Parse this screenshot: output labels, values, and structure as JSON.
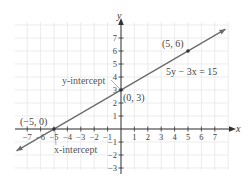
{
  "chart_data": {
    "type": "line",
    "title": "",
    "xlabel": "x",
    "ylabel": "y",
    "xlim": [
      -8,
      8
    ],
    "ylim": [
      -3.2,
      8
    ],
    "grid": true,
    "x_ticks": [
      -7,
      -6,
      -5,
      -4,
      -3,
      -2,
      -1,
      1,
      2,
      3,
      4,
      5,
      6,
      7
    ],
    "y_ticks": [
      -3,
      -2,
      -1,
      1,
      2,
      3,
      4,
      5,
      6,
      7
    ],
    "x_tick_labels": [
      "−7",
      "−6",
      "−5",
      "−4",
      "−3",
      "−2",
      "−1",
      "1",
      "2",
      "3",
      "4",
      "5",
      "6",
      "7"
    ],
    "y_tick_labels": [
      "−3",
      "−2",
      "−1",
      "1",
      "2",
      "3",
      "4",
      "5",
      "6",
      "7"
    ],
    "series": [
      {
        "name": "5y − 3x = 15",
        "equation": "5y − 3x = 15",
        "slope": 0.6,
        "intercept": 3,
        "x": [
          -7.8,
          7.8
        ],
        "y": [
          -1.68,
          7.68
        ]
      }
    ],
    "points": [
      {
        "x": -5,
        "y": 0,
        "label": "(−5, 0)"
      },
      {
        "x": 0,
        "y": 3,
        "label": "(0, 3)"
      },
      {
        "x": 5,
        "y": 6,
        "label": "(5, 6)"
      }
    ],
    "annotations": [
      {
        "text": "y-intercept",
        "points_to": [
          0,
          3
        ]
      },
      {
        "text": "x-intercept",
        "points_to": [
          -5,
          0
        ]
      },
      {
        "text": "5y − 3x = 15"
      }
    ]
  },
  "labels": {
    "x_axis": "x",
    "y_axis": "y",
    "equation": "5y − 3x = 15",
    "point_a": "(−5, 0)",
    "point_b": "(0, 3)",
    "point_c": "(5, 6)",
    "y_intercept": "y-intercept",
    "x_intercept": "x-intercept"
  },
  "colors": {
    "grid": "#e4e4e4",
    "axis": "#333333",
    "line": "#6b6b6b",
    "text": "#444444"
  }
}
